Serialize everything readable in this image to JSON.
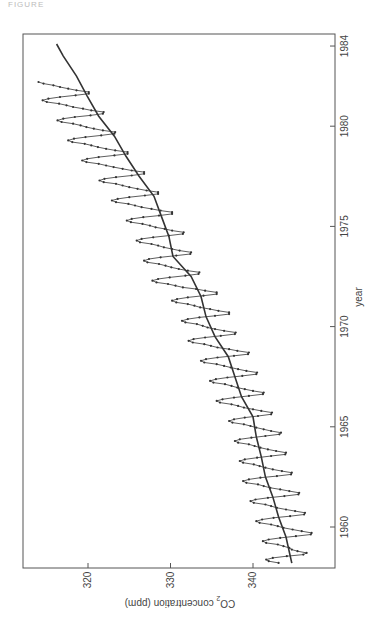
{
  "figure_label": "FIGURE",
  "chart_data": {
    "type": "line",
    "title": "",
    "orientation": "rotated 90° clockwise (year axis vertical on right, CO2 axis horizontal at bottom)",
    "xlabel": "year",
    "ylabel": "CO2 concentration (ppm)",
    "xlim": [
      1958.0,
      1984.3
    ],
    "ylim": [
      313.5,
      348.0
    ],
    "x_ticks": [
      1960,
      1965,
      1970,
      1975,
      1980,
      1984
    ],
    "y_ticks": [
      320,
      330,
      340
    ],
    "grid": false,
    "legend": null,
    "series": [
      {
        "name": "Monthly CO2 (with markers)",
        "style": "line with dot markers",
        "x_start": 1958.208,
        "x_step": 0.08333,
        "values": [
          316.9,
          318.1,
          318.4,
          317.6,
          315.9,
          313.9,
          313.5,
          314.6,
          315.3,
          315.6,
          316.3,
          317.0,
          318.4,
          318.8,
          318.1,
          316.7,
          314.8,
          313.0,
          312.9,
          314.1,
          315.2,
          316.3,
          317.0,
          317.8,
          319.2,
          319.6,
          318.9,
          317.5,
          315.5,
          313.8,
          313.7,
          314.9,
          316.0,
          317.1,
          317.8,
          318.5,
          319.9,
          320.3,
          319.7,
          318.2,
          316.2,
          314.5,
          314.4,
          315.6,
          316.7,
          317.9,
          318.7,
          319.4,
          320.8,
          321.2,
          320.5,
          319.1,
          317.1,
          315.4,
          315.3,
          316.5,
          317.6,
          318.5,
          319.2,
          319.9,
          321.2,
          321.6,
          321.0,
          319.5,
          317.8,
          316.1,
          316.0,
          317.2,
          318.2,
          319.1,
          319.8,
          320.5,
          321.8,
          322.2,
          321.6,
          320.2,
          318.5,
          316.8,
          316.6,
          317.8,
          318.7,
          319.6,
          320.3,
          321.1,
          322.5,
          322.9,
          322.3,
          321.0,
          319.4,
          317.8,
          317.7,
          319.0,
          320.0,
          321.1,
          321.8,
          322.6,
          324.0,
          324.4,
          323.7,
          322.3,
          320.5,
          318.8,
          318.7,
          320.0,
          321.0,
          321.9,
          322.6,
          323.4,
          324.8,
          325.2,
          324.5,
          323.1,
          321.3,
          319.6,
          319.5,
          320.8,
          321.8,
          322.7,
          323.5,
          324.4,
          325.9,
          326.3,
          325.7,
          324.3,
          322.3,
          320.6,
          320.5,
          321.9,
          322.9,
          324.3,
          325.1,
          325.9,
          327.3,
          327.8,
          327.2,
          325.8,
          323.9,
          322.2,
          322.1,
          323.5,
          324.6,
          325.5,
          326.1,
          326.8,
          328.2,
          328.6,
          327.9,
          326.5,
          324.6,
          322.9,
          322.9,
          324.2,
          325.2,
          326.4,
          327.1,
          327.9,
          329.3,
          329.8,
          329.2,
          327.9,
          326.0,
          324.4,
          324.4,
          325.8,
          326.9,
          328.5,
          329.4,
          330.3,
          331.7,
          332.2,
          331.5,
          330.1,
          328.2,
          326.6,
          326.5,
          327.9,
          329.0,
          329.9,
          330.6,
          331.4,
          332.8,
          333.2,
          332.6,
          331.2,
          329.3,
          327.6,
          327.5,
          328.9,
          329.8,
          330.8,
          331.5,
          332.3,
          333.7,
          334.1,
          333.5,
          332.1,
          330.2,
          328.5,
          328.4,
          329.8,
          330.7,
          331.8,
          332.5,
          333.4,
          334.8,
          335.3,
          334.7,
          333.3,
          331.4,
          329.8,
          329.8,
          331.2,
          332.3,
          333.5,
          334.3,
          335.1,
          336.6,
          337.1,
          336.4,
          335.0,
          333.1,
          331.5,
          331.5,
          332.9,
          334.0,
          335.0,
          335.8,
          336.6,
          338.1,
          338.6,
          338.0,
          336.6,
          334.7,
          333.2,
          333.2,
          334.7,
          335.8,
          336.9,
          337.8,
          338.7,
          340.2,
          340.7,
          340.1,
          338.7,
          336.8,
          335.2,
          335.2,
          336.7,
          337.8,
          338.8,
          339.6,
          340.4,
          341.9,
          342.4,
          341.7,
          340.3,
          338.4,
          336.8,
          336.7,
          338.2,
          339.3,
          340.2,
          340.9,
          341.8,
          343.2,
          343.7,
          343.0,
          341.6,
          339.7,
          338.2,
          338.1,
          339.6,
          340.6,
          341.8,
          342.6,
          343.5,
          345.0,
          345.5,
          344.8,
          343.4,
          341.5,
          339.9,
          339.9,
          341.4,
          342.4,
          343.4,
          344.2,
          345.4,
          346.0
        ]
      },
      {
        "name": "Smoothed trend",
        "style": "solid line",
        "x": [
          1958.2,
          1959.5,
          1960.5,
          1961.5,
          1962.5,
          1963.5,
          1964.5,
          1965.5,
          1966.5,
          1967.5,
          1968.5,
          1969.5,
          1970.5,
          1971.5,
          1972.5,
          1973.5,
          1974.5,
          1975.5,
          1976.5,
          1977.5,
          1978.5,
          1979.5,
          1980.5,
          1981.5,
          1982.5,
          1983.5,
          1984.1
        ],
        "values": [
          315.3,
          316.0,
          316.9,
          317.6,
          318.5,
          319.0,
          319.6,
          320.0,
          321.4,
          322.2,
          323.0,
          324.6,
          325.7,
          326.3,
          327.5,
          329.7,
          330.2,
          331.1,
          332.0,
          333.8,
          335.4,
          336.8,
          338.7,
          340.1,
          341.4,
          343.0,
          343.8
        ]
      }
    ]
  },
  "axes": {
    "co2_ticks": [
      "340",
      "330",
      "320"
    ],
    "year_ticks": [
      "1960",
      "1965",
      "1970",
      "1975",
      "1980",
      "1984"
    ],
    "co2_label_main": "CO",
    "co2_label_sub": "2",
    "co2_label_rest": " concentration (ppm)",
    "year_label": "year"
  },
  "colors": {
    "line": "#333333",
    "frame": "#555555"
  }
}
